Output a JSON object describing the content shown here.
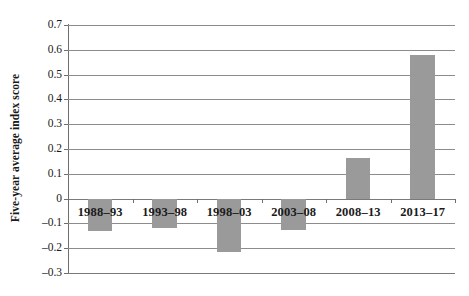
{
  "chart_data": {
    "type": "bar",
    "title": "",
    "subtitle": "",
    "xlabel": "",
    "ylabel": "Five-year average index score",
    "categories": [
      "1988–93",
      "1993–98",
      "1998–03",
      "2003–08",
      "2008–13",
      "2013–17"
    ],
    "values": [
      -0.13,
      -0.12,
      -0.215,
      -0.125,
      0.165,
      0.58
    ],
    "series": [
      {
        "name": "Five-year average index score",
        "values": [
          -0.13,
          -0.12,
          -0.215,
          -0.125,
          0.165,
          0.58
        ]
      }
    ],
    "ylim": [
      -0.3,
      0.7
    ],
    "ytick_step": 0.1,
    "ytick_labels": [
      "0.7",
      "0.6",
      "0.5",
      "0.4",
      "0.3",
      "0.2",
      "0.1",
      "0",
      "–0.1",
      "–0.2",
      "–0.3"
    ],
    "ytick_values": [
      0.7,
      0.6,
      0.5,
      0.4,
      0.3,
      0.2,
      0.1,
      0,
      -0.1,
      -0.2,
      -0.3
    ],
    "grid": true,
    "grid_axis": "y",
    "legend": false,
    "legend_position": "none",
    "bar_color": "#9a9a9a",
    "gridline_color": "#8c8c8c",
    "axis_color": "#6e6e6e",
    "background_color": "#ffffff",
    "category_labels_inside_plot": true
  }
}
